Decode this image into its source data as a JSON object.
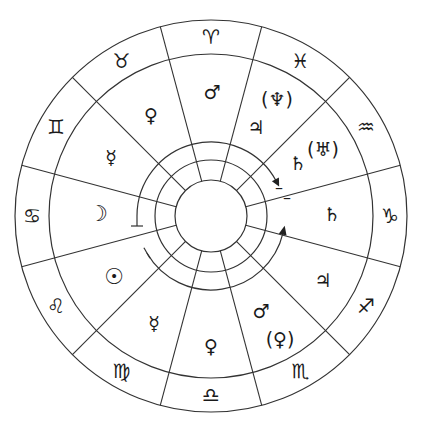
{
  "diagram": {
    "type": "astrological-chart-wheel",
    "center": [
      211,
      216
    ],
    "radii": {
      "outer": 196,
      "sign_inner": 162,
      "arc_ring": 74,
      "ring_mid": 56,
      "ring_inner": 36
    },
    "line_color": "#333333",
    "signs": [
      {
        "name": "Aries",
        "glyph": "♈︎",
        "angle": 0
      },
      {
        "name": "Pisces",
        "glyph": "♓︎",
        "angle": 30
      },
      {
        "name": "Aquarius",
        "glyph": "♒︎",
        "angle": 60
      },
      {
        "name": "Capricorn",
        "glyph": "♑︎",
        "angle": 90
      },
      {
        "name": "Sagittarius",
        "glyph": "♐︎",
        "angle": 120
      },
      {
        "name": "Scorpio",
        "glyph": "♏︎",
        "angle": 150
      },
      {
        "name": "Libra",
        "glyph": "♎︎",
        "angle": 180
      },
      {
        "name": "Virgo",
        "glyph": "♍︎",
        "angle": 210
      },
      {
        "name": "Leo",
        "glyph": "♌︎",
        "angle": 240
      },
      {
        "name": "Cancer",
        "glyph": "♋︎",
        "angle": 270
      },
      {
        "name": "Gemini",
        "glyph": "♊︎",
        "angle": 300
      },
      {
        "name": "Taurus",
        "glyph": "♉︎",
        "angle": 330
      }
    ],
    "planets": [
      {
        "sign": "Aries",
        "name": "Mars",
        "glyph": "♂",
        "x": 212,
        "y": 92
      },
      {
        "sign": "Pisces",
        "name": "Neptune (parenthetical)",
        "glyph": "(♆)",
        "x": 277,
        "y": 99
      },
      {
        "sign": "Pisces",
        "name": "Jupiter",
        "glyph": "♃",
        "x": 256,
        "y": 127
      },
      {
        "sign": "Aquarius",
        "name": "Saturn",
        "glyph": "♄",
        "x": 298,
        "y": 163
      },
      {
        "sign": "Aquarius",
        "name": "Uranus (parenthetical)",
        "glyph": "(♅)",
        "x": 323,
        "y": 149
      },
      {
        "sign": "Capricorn",
        "name": "Saturn",
        "glyph": "♄",
        "x": 332,
        "y": 214
      },
      {
        "sign": "Sagittarius",
        "name": "Jupiter",
        "glyph": "♃",
        "x": 323,
        "y": 280
      },
      {
        "sign": "Scorpio",
        "name": "Mars",
        "glyph": "♂",
        "x": 261,
        "y": 311
      },
      {
        "sign": "Scorpio",
        "name": "Pluto (parenthetical)",
        "glyph": "(♀)",
        "x": 280,
        "y": 339
      },
      {
        "sign": "Libra",
        "name": "Venus",
        "glyph": "♀",
        "x": 211,
        "y": 346
      },
      {
        "sign": "Virgo",
        "name": "Mercury",
        "glyph": "☿",
        "x": 154,
        "y": 323
      },
      {
        "sign": "Leo",
        "name": "Sun",
        "glyph": "☉",
        "x": 114,
        "y": 277
      },
      {
        "sign": "Cancer",
        "name": "Moon",
        "glyph": "☽",
        "x": 98,
        "y": 214
      },
      {
        "sign": "Gemini",
        "name": "Mercury",
        "glyph": "☿",
        "x": 111,
        "y": 157
      },
      {
        "sign": "Taurus",
        "name": "Venus",
        "glyph": "♀",
        "x": 151,
        "y": 115
      }
    ],
    "arcs": [
      {
        "name": "upper-arc",
        "start_angle": 270,
        "end_angle": 62,
        "direction": "clockwise",
        "start_cap": "tee",
        "end_cap": "arrow"
      },
      {
        "name": "lower-arc",
        "start_angle": 240,
        "end_angle": 103,
        "direction": "counterclockwise",
        "start_cap": "tee",
        "end_cap": "arrow"
      }
    ],
    "marks": [
      {
        "name": "upper-arrow-bar",
        "glyph": "–",
        "x": 279,
        "y": 188
      },
      {
        "name": "lower-arrow-bar",
        "glyph": "–",
        "x": 287,
        "y": 198
      }
    ]
  }
}
